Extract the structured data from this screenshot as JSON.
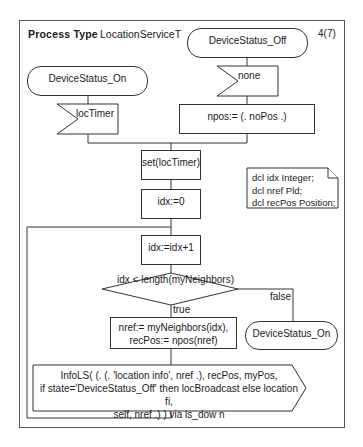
{
  "diagram": {
    "header": {
      "keyword": "Process Type",
      "name": "LocationServiceT",
      "page": "4(7)"
    },
    "states": [
      {
        "id": "state-on-top",
        "label": "DeviceStatus_On"
      },
      {
        "id": "state-off-top",
        "label": "DeviceStatus_Off"
      },
      {
        "id": "state-on-next",
        "label": "DeviceStatus_On"
      }
    ],
    "inputs": [
      {
        "id": "input-loctimer",
        "label": "locTimer"
      },
      {
        "id": "input-none",
        "label": "none"
      }
    ],
    "tasks": [
      {
        "id": "task-npos",
        "label": "npos:= (. noPos .)"
      },
      {
        "id": "task-set-timer",
        "label": "set(locTimer)"
      },
      {
        "id": "task-idx-init",
        "label": "idx:=0"
      },
      {
        "id": "task-idx-inc",
        "label": "idx:=idx+1"
      },
      {
        "id": "task-nref",
        "lines": [
          "nref:= myNeighbors(idx),",
          "recPos:= npos(nref)"
        ]
      }
    ],
    "decision": {
      "label": "idx < length(myNeighbors)",
      "true_label": "true",
      "false_label": "false"
    },
    "output": {
      "lines": [
        "InfoLS( (. (. 'location info', nref .), recPos, myPos,",
        "if state='DeviceStatus_Off' then locBroadcast else location fi,",
        "self, nref .) ) via ls_dow n"
      ]
    },
    "declarations": {
      "lines": [
        "dcl idx Integer;",
        "dcl nref Pld;",
        "dcl recPos Position;"
      ]
    },
    "colors": {
      "line": "#333333",
      "frame": "#555555",
      "background": "#ffffff"
    }
  }
}
